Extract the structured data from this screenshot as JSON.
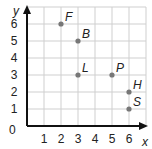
{
  "chart_data": {
    "type": "scatter",
    "title": "",
    "xlabel": "x",
    "ylabel": "y",
    "xlim": [
      0,
      7
    ],
    "ylim": [
      0,
      7
    ],
    "grid": true,
    "origin_label": "0",
    "x_ticks": [
      "1",
      "2",
      "3",
      "4",
      "5",
      "6"
    ],
    "y_ticks": [
      "1",
      "2",
      "3",
      "4",
      "5",
      "6"
    ],
    "points": [
      {
        "label": "F",
        "x": 2,
        "y": 6
      },
      {
        "label": "B",
        "x": 3,
        "y": 5
      },
      {
        "label": "L",
        "x": 3,
        "y": 3
      },
      {
        "label": "P",
        "x": 5,
        "y": 3
      },
      {
        "label": "H",
        "x": 6,
        "y": 2
      },
      {
        "label": "S",
        "x": 6,
        "y": 1
      }
    ],
    "colors": {
      "grid": "#cfcfcf",
      "axis": "#111111",
      "point": "#777777"
    }
  }
}
